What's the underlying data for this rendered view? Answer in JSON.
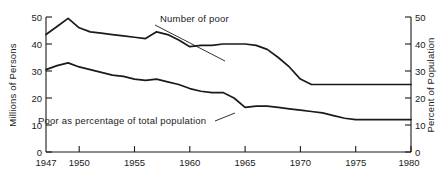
{
  "chart_data": {
    "type": "line",
    "title": "",
    "xlabel": "",
    "ylabel": "Millions of Persons",
    "ylabel_right": "Percent of Population",
    "xlim": [
      1947,
      1980
    ],
    "ylim": [
      0,
      50
    ],
    "ylim_right": [
      0,
      50
    ],
    "grid": false,
    "legend_position": "inline-annotations",
    "xticks": [
      "1947",
      "1950",
      "1955",
      "1960",
      "1965",
      "1970",
      "1975",
      "1980"
    ],
    "xtick_values": [
      1947,
      1950,
      1955,
      1960,
      1965,
      1970,
      1975,
      1980
    ],
    "yticks": [
      "0",
      "10",
      "20",
      "30",
      "40",
      "50"
    ],
    "ytick_values": [
      0,
      10,
      20,
      30,
      40,
      50
    ],
    "yticks_right": [
      "0",
      "10",
      "20",
      "30",
      "40",
      "50"
    ],
    "ytick_values_right": [
      0,
      10,
      20,
      30,
      40,
      50
    ],
    "x": [
      1947,
      1948,
      1949,
      1950,
      1951,
      1952,
      1953,
      1954,
      1955,
      1956,
      1957,
      1958,
      1959,
      1960,
      1961,
      1962,
      1963,
      1964,
      1965,
      1966,
      1967,
      1968,
      1969,
      1970,
      1971,
      1972,
      1973,
      1974,
      1975,
      1976,
      1977,
      1978,
      1979,
      1980
    ],
    "series": [
      {
        "name": "Number of poor",
        "unit": "millions of persons",
        "axis": "left",
        "values": [
          43.5,
          46.5,
          49.5,
          46.0,
          44.5,
          44.0,
          43.5,
          43.0,
          42.5,
          42.0,
          44.5,
          43.5,
          41.5,
          39.0,
          39.5,
          39.5,
          40.0,
          40.0,
          40.0,
          39.5,
          38.0,
          35.0,
          31.5,
          27.0,
          25.0,
          25.0,
          25.0,
          25.0,
          25.0,
          25.0,
          25.0,
          25.0,
          25.0,
          25.0
        ]
      },
      {
        "name": "Poor as percentage of total population",
        "unit": "percent of population",
        "axis": "right",
        "values": [
          30.5,
          32.0,
          33.0,
          31.5,
          30.5,
          29.5,
          28.5,
          28.0,
          27.0,
          26.5,
          27.0,
          26.0,
          25.0,
          23.5,
          22.5,
          22.0,
          22.0,
          20.0,
          16.5,
          17.0,
          17.0,
          16.5,
          16.0,
          15.5,
          15.0,
          14.5,
          13.5,
          12.5,
          12.0,
          12.0,
          12.0,
          12.0,
          12.0,
          12.0
        ]
      }
    ],
    "annotations": [
      {
        "id": "upper",
        "text": "Number of poor",
        "points_to_x": 1964,
        "points_to_y": 40
      },
      {
        "id": "lower",
        "text": "Poor as percentage of total population",
        "points_to_x": 1965,
        "points_to_y": 16.5
      }
    ]
  }
}
